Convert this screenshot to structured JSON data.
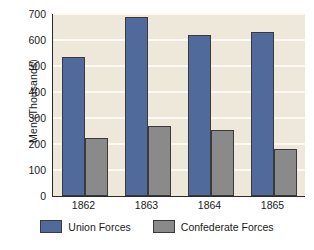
{
  "chart_data": {
    "type": "bar",
    "title": "",
    "xlabel": "",
    "ylabel": "Men (Thousands)",
    "categories": [
      "1862",
      "1863",
      "1864",
      "1865"
    ],
    "series": [
      {
        "name": "Union Forces",
        "color": "#4f6a9b",
        "values": [
          535,
          690,
          618,
          630
        ]
      },
      {
        "name": "Confederate Forces",
        "color": "#8a8a8a",
        "values": [
          225,
          268,
          255,
          180
        ]
      }
    ],
    "ylim": [
      0,
      700
    ],
    "yticks": [
      0,
      100,
      200,
      300,
      400,
      500,
      600,
      700
    ],
    "ytick_labels": [
      "0",
      "100",
      "200",
      "300",
      "400",
      "500",
      "600",
      "700"
    ],
    "grid": true,
    "grid_color": "#fbf9f2",
    "plot_background": "#ede8d9",
    "legend_position": "bottom",
    "bar_outline_color": "#3a3a3a"
  }
}
